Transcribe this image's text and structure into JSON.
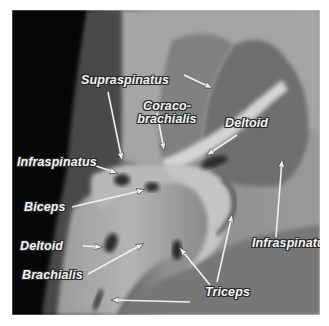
{
  "image": {
    "description": "Lateral radiograph of shoulder joint with labeled muscle attachments",
    "frame_color": "#ffffff",
    "label_color": "#f4f4f4",
    "label_outline_color": "#2a2a2a"
  },
  "labels": {
    "supraspinatus": "Supraspinatus",
    "coracobrachialis_line1": "Coraco-",
    "coracobrachialis_line2": "brachialis",
    "deltoid_top": "Deltoid",
    "infraspinatus_left": "Infraspinatus",
    "biceps": "Biceps",
    "deltoid_left": "Deltoid",
    "brachialis": "Brachialis",
    "triceps": "Triceps",
    "infraspinatus_right": "Infraspinatus"
  }
}
